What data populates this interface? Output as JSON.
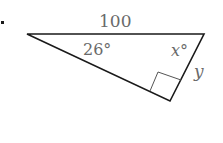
{
  "figure": {
    "side_label": "100",
    "angle_a_label": "26°",
    "angle_x_label": "x°",
    "side_y_label": "y",
    "right_angle_marker": true,
    "line_color": "#1a1a1a",
    "label_color": "#6a6a6a"
  }
}
